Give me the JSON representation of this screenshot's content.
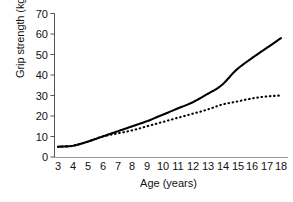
{
  "chart_data": {
    "type": "line",
    "title": "",
    "xlabel": "Age (years)",
    "ylabel": "Grip strength (kg)",
    "xlim": [
      3,
      18
    ],
    "ylim": [
      0,
      70
    ],
    "grid": false,
    "legend": "none",
    "xticks": [
      "3",
      "4",
      "5",
      "6",
      "7",
      "8",
      "9",
      "10",
      "11",
      "12",
      "13",
      "14",
      "15",
      "16",
      "17",
      "18"
    ],
    "yticks": [
      "0",
      "10",
      "20",
      "30",
      "40",
      "50",
      "60",
      "70"
    ],
    "x": [
      3,
      4,
      5,
      6,
      7,
      8,
      9,
      10,
      11,
      12,
      13,
      14,
      15,
      16,
      17,
      18
    ],
    "series": [
      {
        "name": "solid-line",
        "style": "solid",
        "color": "#000000",
        "values": [
          5,
          5.5,
          7.5,
          10,
          12.5,
          15,
          17.5,
          20.5,
          23.5,
          26.5,
          30.5,
          35,
          42.5,
          48,
          53,
          58
        ]
      },
      {
        "name": "dotted-line",
        "style": "dotted",
        "color": "#000000",
        "values": [
          5,
          5.5,
          7.5,
          10,
          11.5,
          13,
          15,
          17,
          19,
          21,
          23,
          25.5,
          27,
          28.5,
          29.5,
          30
        ]
      }
    ]
  },
  "axes": {
    "y_axis_color": "#555555",
    "x_axis_color": "#888888"
  }
}
